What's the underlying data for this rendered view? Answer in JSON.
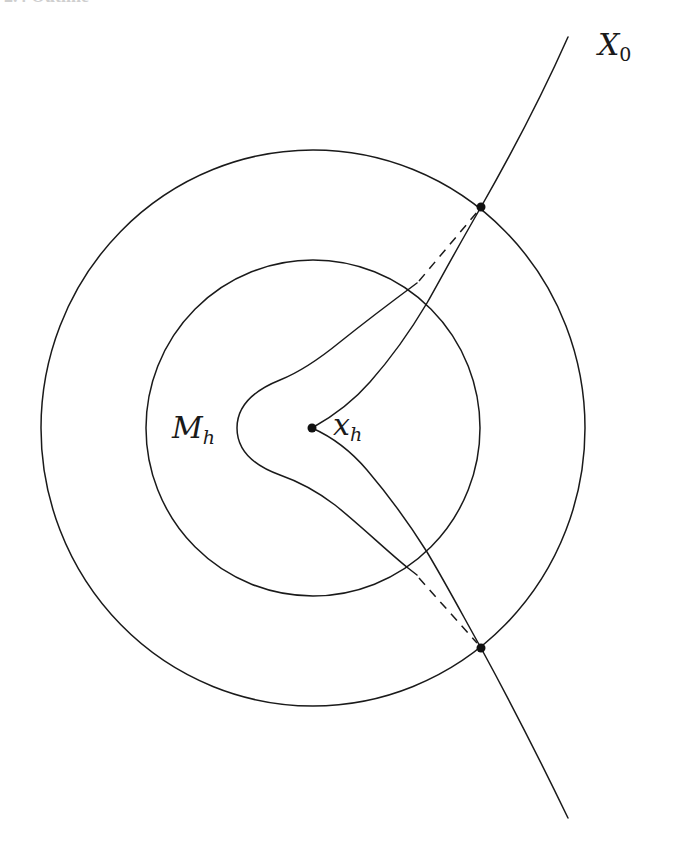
{
  "header": {
    "cut_off_text": "2.4 Outline"
  },
  "figure": {
    "type": "geometric-diagram",
    "labels": {
      "curve_main": {
        "base": "X",
        "sub": "0"
      },
      "manifold": {
        "base": "M",
        "sub": "h"
      },
      "center_point": {
        "base": "x",
        "sub": "h"
      }
    },
    "elements": {
      "outer_circle": {
        "cx": 313,
        "cy": 428,
        "rx": 272,
        "ry": 278
      },
      "inner_circle": {
        "cx": 313,
        "cy": 428,
        "rx": 167,
        "ry": 168
      },
      "center_point": {
        "x": 312,
        "y": 428
      },
      "intersection_points": [
        {
          "x": 481,
          "y": 207
        },
        {
          "x": 481,
          "y": 648
        }
      ],
      "curve_X0_endpoints": [
        {
          "x": 568,
          "y": 37
        },
        {
          "x": 568,
          "y": 818
        }
      ],
      "dashed_segments": 2
    },
    "colors": {
      "ink": "#1a1a1a",
      "background": "#ffffff"
    }
  }
}
